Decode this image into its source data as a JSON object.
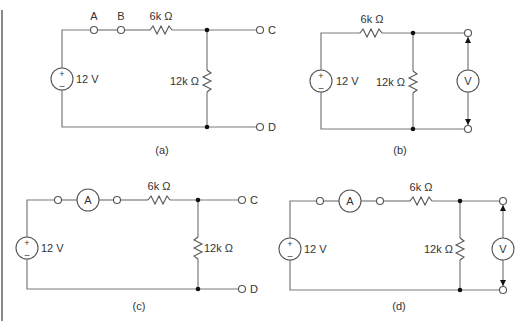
{
  "figure": {
    "panels": [
      {
        "id": "a",
        "caption": "(a)",
        "source_label": "12 V",
        "source_plus": "+",
        "source_minus": "–",
        "series_resistor_label": "6k Ω",
        "shunt_resistor_label": "12k Ω",
        "terminals": {
          "a": "A",
          "b": "B",
          "c": "C",
          "d": "D"
        }
      },
      {
        "id": "b",
        "caption": "(b)",
        "source_label": "12 V",
        "source_plus": "+",
        "source_minus": "–",
        "series_resistor_label": "6k Ω",
        "shunt_resistor_label": "12k Ω",
        "voltmeter_label": "V"
      },
      {
        "id": "c",
        "caption": "(c)",
        "source_label": "12 V",
        "source_plus": "+",
        "source_minus": "–",
        "series_resistor_label": "6k Ω",
        "shunt_resistor_label": "12k Ω",
        "ammeter_label": "A",
        "terminals": {
          "c": "C",
          "d": "D"
        }
      },
      {
        "id": "d",
        "caption": "(d)",
        "source_label": "12 V",
        "source_plus": "+",
        "source_minus": "–",
        "series_resistor_label": "6k Ω",
        "shunt_resistor_label": "12k Ω",
        "ammeter_label": "A",
        "voltmeter_label": "V"
      }
    ]
  }
}
